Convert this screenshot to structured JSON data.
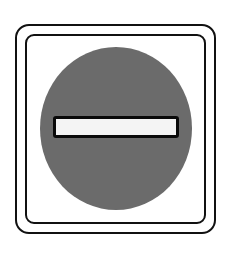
{
  "sign": {
    "type": "no-entry",
    "colors": {
      "frame": "#111111",
      "background": "#ffffff",
      "disc": "#6b6b6b",
      "bar_fill": "#f4f4f4",
      "bar_outline": "#0a0a0a"
    }
  }
}
